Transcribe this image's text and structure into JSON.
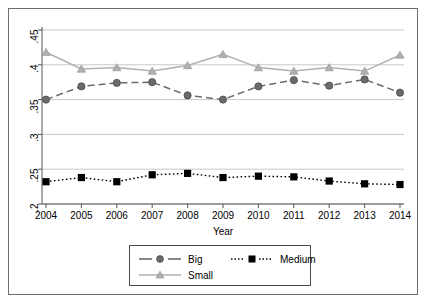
{
  "chart_data": {
    "type": "line",
    "title": "",
    "subtitle": "",
    "xlabel": "Year",
    "ylabel": "",
    "categories": [
      2004,
      2005,
      2006,
      2007,
      2008,
      2009,
      2010,
      2011,
      2012,
      2013,
      2014
    ],
    "x_tick_labels": [
      "2004",
      "2005",
      "2006",
      "2007",
      "2008",
      "2009",
      "2010",
      "2011",
      "2012",
      "2013",
      "2014"
    ],
    "y_tick_labels": [
      ".2",
      ".25",
      ".3",
      ".35",
      ".4",
      ".45"
    ],
    "y_tick_values": [
      0.2,
      0.25,
      0.3,
      0.35,
      0.4,
      0.45
    ],
    "ylim": [
      0.2,
      0.45
    ],
    "xlim": [
      2004,
      2014
    ],
    "grid": "horizontal",
    "legend_position": "bottom-center",
    "series": [
      {
        "name": "Big",
        "color": "#6b6b6b",
        "marker": "circle",
        "linestyle": "dashed",
        "values": [
          0.35,
          0.369,
          0.374,
          0.375,
          0.356,
          0.35,
          0.369,
          0.378,
          0.37,
          0.379,
          0.36
        ]
      },
      {
        "name": "Medium",
        "color": "#000000",
        "marker": "square",
        "linestyle": "dotted",
        "values": [
          0.232,
          0.238,
          0.232,
          0.242,
          0.244,
          0.238,
          0.24,
          0.239,
          0.233,
          0.229,
          0.228
        ]
      },
      {
        "name": "Small",
        "color": "#b0b0b0",
        "marker": "triangle",
        "linestyle": "solid",
        "values": [
          0.418,
          0.394,
          0.396,
          0.391,
          0.399,
          0.415,
          0.396,
          0.391,
          0.396,
          0.391,
          0.414
        ]
      }
    ]
  },
  "legend": {
    "entries": [
      {
        "label": "Big"
      },
      {
        "label": "Medium"
      },
      {
        "label": "Small"
      }
    ]
  },
  "axes": {
    "x_title": "Year"
  },
  "colors": {
    "big": "#6b6b6b",
    "medium": "#000000",
    "small": "#b0b0b0",
    "grid": "#c8c8c8",
    "axis": "#555555",
    "frame": "#6f6f6f"
  }
}
